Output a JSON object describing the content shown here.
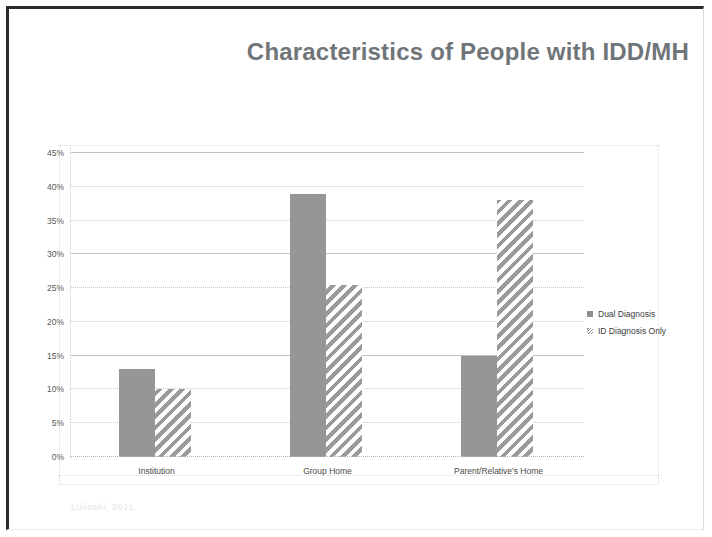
{
  "slide": {
    "title": "Characteristics of People with IDD/MH",
    "footnote": "Lulinski, 2011."
  },
  "legend": {
    "position": "right",
    "items": [
      {
        "label": "Dual Diagnosis",
        "swatch": "solid",
        "color": "#969696"
      },
      {
        "label": "ID Diagnosis Only",
        "swatch": "hatch",
        "color": "#9a9a9a"
      }
    ]
  },
  "chart_data": {
    "type": "bar",
    "title": "",
    "xlabel": "",
    "ylabel": "",
    "ylim": [
      0,
      45
    ],
    "ytick_labels": [
      "0%",
      "5%",
      "10%",
      "15%",
      "20%",
      "25%",
      "30%",
      "35%",
      "40%",
      "45%"
    ],
    "ytick_values": [
      0,
      5,
      10,
      15,
      20,
      25,
      30,
      35,
      40,
      45
    ],
    "grid": true,
    "categories": [
      "Institution",
      "Group Home",
      "Parent/Relative's Home"
    ],
    "series": [
      {
        "name": "Dual Diagnosis",
        "values": [
          13,
          39,
          15
        ]
      },
      {
        "name": "ID Diagnosis Only",
        "values": [
          10,
          25.5,
          38
        ]
      }
    ]
  }
}
